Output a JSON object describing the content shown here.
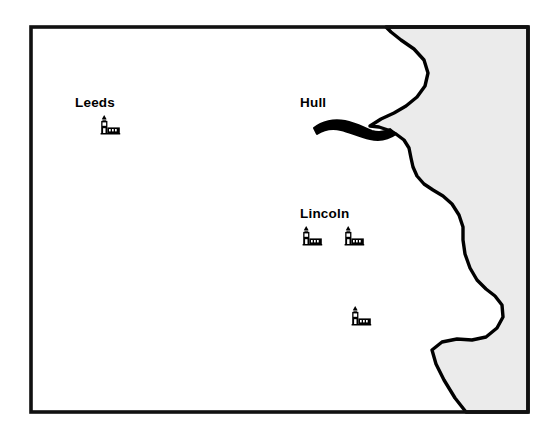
{
  "map": {
    "title": "Historic map of the Humber region",
    "frame": {
      "stroke_color": "#111111",
      "fill_color": "#ffffff",
      "x": 31,
      "y": 27,
      "width": 497,
      "height": 385
    },
    "sea": {
      "name": "North Sea",
      "fill_color": "#ebebeb",
      "stroke_color": "#000000"
    },
    "estuary": {
      "name": "Humber Estuary",
      "stroke_color": "#000000"
    },
    "labels": [
      {
        "id": "leeds",
        "text": "Leeds",
        "x": 75,
        "y": 107
      },
      {
        "id": "hull",
        "text": "Hull",
        "x": 300,
        "y": 107
      },
      {
        "id": "lincoln",
        "text": "Lincoln",
        "x": 300,
        "y": 218
      }
    ],
    "settlements": [
      {
        "id": "church-leeds",
        "label": "Leeds",
        "x": 98,
        "y": 115
      },
      {
        "id": "church-lincoln-west",
        "label": "Lincoln",
        "x": 300,
        "y": 226
      },
      {
        "id": "church-lincoln-east",
        "label": "Lincoln",
        "x": 342,
        "y": 226
      },
      {
        "id": "church-south",
        "label": "",
        "x": 349,
        "y": 306
      }
    ],
    "symbol_legend": {
      "church": "church-icon"
    }
  }
}
